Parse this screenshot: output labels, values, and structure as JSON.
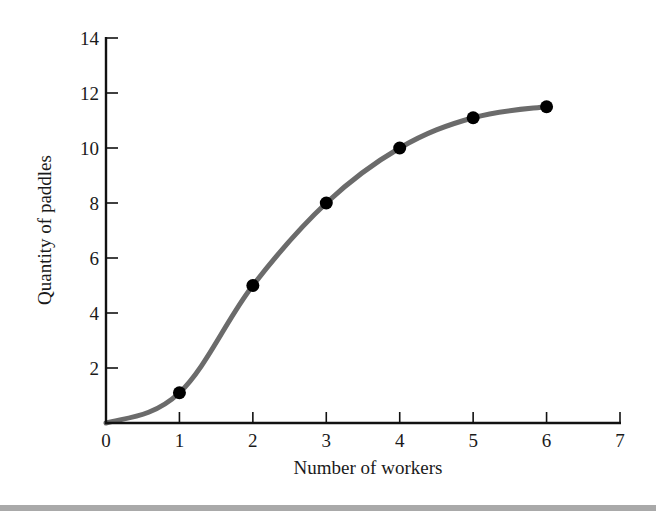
{
  "chart_data": {
    "type": "line",
    "title": "",
    "xlabel": "Number of workers",
    "ylabel": "Quantity of paddles",
    "xlim": [
      0,
      7
    ],
    "ylim": [
      0,
      14
    ],
    "x_ticks": [
      0,
      1,
      2,
      3,
      4,
      5,
      6,
      7
    ],
    "y_ticks": [
      2,
      4,
      6,
      8,
      10,
      12,
      14
    ],
    "grid": false,
    "legend": null,
    "series": [
      {
        "name": "Total product",
        "style": "smooth curve with markers",
        "line_color": "#6b6b6b",
        "marker_color": "#000000",
        "x": [
          1,
          2,
          3,
          4,
          5,
          6
        ],
        "values": [
          1.1,
          5,
          8,
          10,
          11.1,
          11.5
        ]
      }
    ],
    "curve_start": [
      0,
      0
    ]
  },
  "labels": {
    "x_axis": "Number of workers",
    "y_axis": "Quantity of paddles",
    "x_ticks": [
      "0",
      "1",
      "2",
      "3",
      "4",
      "5",
      "6",
      "7"
    ],
    "y_ticks": [
      "2",
      "4",
      "6",
      "8",
      "10",
      "12",
      "14"
    ]
  }
}
